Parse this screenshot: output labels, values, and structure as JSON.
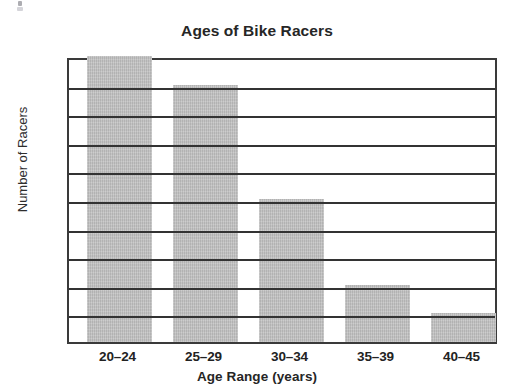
{
  "chart_data": {
    "type": "bar",
    "title": "Ages of Bike Racers",
    "xlabel": "Age Range (years)",
    "ylabel": "Number of Racers",
    "categories": [
      "20–24",
      "25–29",
      "30–34",
      "35–39",
      "40–45"
    ],
    "values": [
      50,
      45,
      25,
      10,
      5
    ],
    "ylim": [
      0,
      50
    ],
    "ytick_labels": [
      "0",
      "5",
      "10",
      "15",
      "20",
      "25",
      "30",
      "35",
      "40",
      "45",
      "50"
    ],
    "ytick_values": [
      0,
      5,
      10,
      15,
      20,
      25,
      30,
      35,
      40,
      45,
      50
    ],
    "grid": "horizontal",
    "legend": "none",
    "bar_color": "#bcbcbc",
    "axis_color": "#333333",
    "text_color": "#222222",
    "background_color": "#ffffff"
  }
}
